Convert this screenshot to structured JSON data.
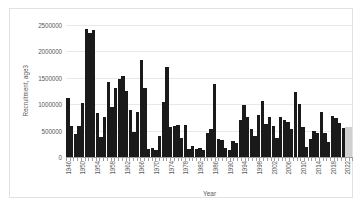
{
  "chart_data": {
    "type": "bar",
    "title": "",
    "xlabel": "Year",
    "ylabel": "Recruitment, age3",
    "ylim": [
      0,
      2500000
    ],
    "ytick_labels": [
      "2500000",
      "2000000",
      "1500000",
      "1000000",
      "500000",
      "0"
    ],
    "ytick_values": [
      2500000,
      2000000,
      1500000,
      1000000,
      500000,
      0
    ],
    "grid": true,
    "legend": "none",
    "xtick_labels": [
      "1946",
      "1950",
      "1954",
      "1958",
      "1962",
      "1966",
      "1970",
      "1974",
      "1978",
      "1982",
      "1986",
      "1990",
      "1994",
      "1998",
      "2002",
      "2006",
      "2010",
      "2014",
      "2018",
      "2022"
    ],
    "xtick_step": 4,
    "bar_color": "#1a1a1a",
    "projection_color": "#d0d0d0",
    "projection_years": [
      2022,
      2023
    ],
    "categories": [
      1946,
      1947,
      1948,
      1949,
      1950,
      1951,
      1952,
      1953,
      1954,
      1955,
      1956,
      1957,
      1958,
      1959,
      1960,
      1961,
      1962,
      1963,
      1964,
      1965,
      1966,
      1967,
      1968,
      1969,
      1970,
      1971,
      1972,
      1973,
      1974,
      1975,
      1976,
      1977,
      1978,
      1979,
      1980,
      1981,
      1982,
      1983,
      1984,
      1985,
      1986,
      1987,
      1988,
      1989,
      1990,
      1991,
      1992,
      1993,
      1994,
      1995,
      1996,
      1997,
      1998,
      1999,
      2000,
      2001,
      2002,
      2003,
      2004,
      2005,
      2006,
      2007,
      2008,
      2009,
      2010,
      2011,
      2012,
      2013,
      2014,
      2015,
      2016,
      2017,
      2018,
      2019,
      2020,
      2021,
      2022,
      2023
    ],
    "values": [
      1120000,
      580000,
      430000,
      590000,
      1030000,
      2420000,
      2340000,
      2410000,
      840000,
      380000,
      750000,
      1430000,
      940000,
      1310000,
      1480000,
      1540000,
      1250000,
      890000,
      480000,
      860000,
      1830000,
      1310000,
      150000,
      180000,
      140000,
      400000,
      1050000,
      1710000,
      560000,
      590000,
      600000,
      360000,
      610000,
      160000,
      200000,
      150000,
      170000,
      140000,
      460000,
      530000,
      1380000,
      350000,
      330000,
      180000,
      140000,
      300000,
      260000,
      710000,
      990000,
      750000,
      530000,
      400000,
      790000,
      1060000,
      620000,
      750000,
      590000,
      360000,
      750000,
      700000,
      670000,
      530000,
      1240000,
      1000000,
      570000,
      190000,
      350000,
      490000,
      460000,
      850000,
      450000,
      290000,
      780000,
      740000,
      640000,
      550000,
      560000,
      560000
    ]
  }
}
